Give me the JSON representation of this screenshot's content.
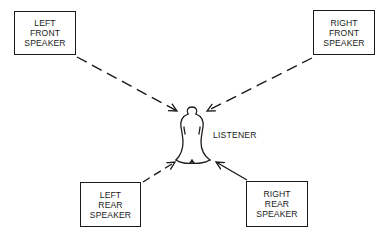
{
  "speakers": {
    "left_front": {
      "line1": "LEFT",
      "line2": "FRONT",
      "line3": "SPEAKER"
    },
    "right_front": {
      "line1": "RIGHT",
      "line2": "FRONT",
      "line3": "SPEAKER"
    },
    "left_rear": {
      "line1": "LEFT",
      "line2": "REAR",
      "line3": "SPEAKER"
    },
    "right_rear": {
      "line1": "RIGHT",
      "line2": "REAR",
      "line3": "SPEAKER"
    }
  },
  "listener": {
    "label": "LISTENER"
  },
  "colors": {
    "ink": "#1a1a1a",
    "background": "#ffffff"
  }
}
